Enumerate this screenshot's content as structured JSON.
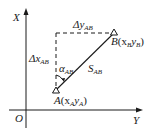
{
  "diagram": {
    "type": "coordinate-geometry",
    "axes": {
      "vertical": {
        "label": "X"
      },
      "horizontal": {
        "label": "Y"
      },
      "origin": {
        "label": "O"
      }
    },
    "points": {
      "A": {
        "name": "A",
        "coords_text": "(x",
        "sub1": "A",
        "mid": "y",
        "sub2": "A",
        "close": ")"
      },
      "B": {
        "name": "B",
        "coords_text": "(x",
        "sub1": "B",
        "mid": "y",
        "sub2": "B",
        "close": ")"
      }
    },
    "annotations": {
      "delta_y": {
        "prefix": "Δy",
        "sub": "AB"
      },
      "delta_x": {
        "prefix": "Δx",
        "sub": "AB"
      },
      "azimuth": {
        "prefix": "α",
        "sub": "AB"
      },
      "distance": {
        "prefix": "S",
        "sub": "AB"
      }
    },
    "colors": {
      "line": "#1a1a1a",
      "background": "#ffffff"
    }
  }
}
